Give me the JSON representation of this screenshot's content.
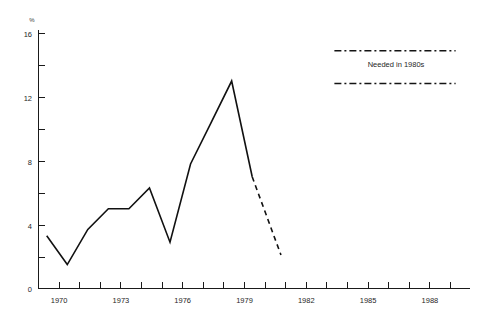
{
  "chart_data": {
    "type": "line",
    "title": "",
    "subtitle": "",
    "xlabel": "",
    "ylabel": "%",
    "xlim": [
      1968.6,
      1989.6
    ],
    "ylim": [
      0,
      16.6
    ],
    "grid": false,
    "legend_position": "inside-top-right",
    "x_ticks": [
      1969,
      1970,
      1971,
      1972,
      1973,
      1974,
      1975,
      1976,
      1977,
      1978,
      1979,
      1980,
      1981,
      1982,
      1983,
      1984,
      1985,
      1986,
      1987,
      1988,
      1989
    ],
    "x_tick_labels": [
      "",
      "1970",
      "",
      "",
      "1973",
      "",
      "",
      "1976",
      "",
      "",
      "1979",
      "",
      "",
      "1982",
      "",
      "",
      "1985",
      "",
      "",
      "1988",
      ""
    ],
    "y_ticks": [
      0,
      2,
      4,
      6,
      8,
      10,
      12,
      14,
      16
    ],
    "y_tick_labels": [
      "0",
      "",
      "4",
      "",
      "8",
      "",
      "12",
      "",
      "16"
    ],
    "series": [
      {
        "name": "Actual",
        "style": "solid",
        "x": [
          1969,
          1970,
          1971,
          1972,
          1973,
          1974,
          1975,
          1976,
          1977,
          1978,
          1979
        ],
        "values": [
          3.3,
          1.5,
          3.7,
          5.0,
          5.0,
          6.3,
          2.9,
          7.8,
          10.4,
          13.0,
          7.0
        ]
      },
      {
        "name": "Projected",
        "style": "dashed",
        "x": [
          1979,
          1980.4
        ],
        "values": [
          7.0,
          2.1
        ]
      }
    ],
    "reference_lines": [
      {
        "label": "Needed in 1980s",
        "value": 14.9,
        "style": "dash-dot",
        "x_start": 1983.0,
        "x_end": 1988.9
      },
      {
        "label": "Needed in 1980s",
        "value": 12.85,
        "style": "dash-dot",
        "x_start": 1983.0,
        "x_end": 1988.9
      }
    ],
    "annotations": [
      {
        "text": "Needed in 1980s",
        "x": 1986.0,
        "y": 13.85
      }
    ]
  },
  "axes": {
    "y_axis_unit": "%"
  },
  "legend": {
    "needed_label": "Needed in 1980s"
  }
}
